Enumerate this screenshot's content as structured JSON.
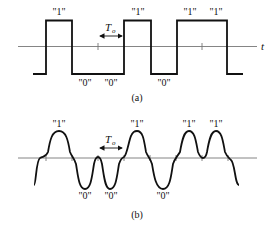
{
  "diagram": {
    "panel_a": {
      "caption": "(a)",
      "axis_label": "t",
      "period_label": "T",
      "period_subscript": "o",
      "bits": [
        "1",
        "0",
        "0",
        "1",
        "0",
        "1",
        "1"
      ],
      "labels_top": [
        "\"1\"",
        "\"1\"",
        "\"1\"",
        "\"1\""
      ],
      "labels_bottom": [
        "\"0\"",
        "\"0\"",
        "\"0\""
      ]
    },
    "panel_b": {
      "caption": "(b)",
      "period_label": "T",
      "period_subscript": "o",
      "bits": [
        "1",
        "0",
        "0",
        "1",
        "0",
        "1",
        "1"
      ],
      "labels_top": [
        "\"1\"",
        "\"1\"",
        "\"1\"",
        "\"1\""
      ],
      "labels_bottom": [
        "\"0\"",
        "\"0\"",
        "\"0\""
      ]
    },
    "colors": {
      "line": "#111111",
      "axis": "#777777"
    }
  }
}
